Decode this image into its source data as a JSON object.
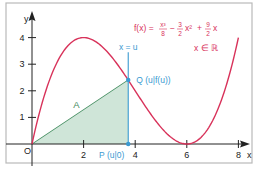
{
  "chart_data": {
    "type": "line",
    "title": "",
    "function_label": {
      "lhs": "f(x) = ",
      "t1_num": "x³",
      "t1_den": "8",
      "op1": "−",
      "t2_num": "3",
      "t2_den": "2",
      "t2_var": "x²",
      "op2": "+",
      "t3_num": "9",
      "t3_den": "2",
      "t3_var": "x"
    },
    "domain_label": "x ∈ ℝ",
    "xlabel": "x",
    "ylabel": "y",
    "xlim": [
      0,
      8.5
    ],
    "ylim": [
      0,
      4.7
    ],
    "x_ticks": [
      2,
      4,
      6,
      8
    ],
    "y_ticks": [
      1,
      2,
      3,
      4
    ],
    "origin_label": "O",
    "grid": false,
    "series": [
      {
        "name": "f(x) = x³/8 − 3/2·x² + 9/2·x",
        "color": "#d8325a",
        "x": [
          0,
          0.5,
          1,
          1.5,
          2,
          2.5,
          3,
          3.5,
          4,
          4.5,
          5,
          5.5,
          6,
          6.5,
          7,
          7.5,
          8
        ],
        "values": [
          0,
          1.89,
          3.13,
          3.8,
          4.0,
          3.83,
          3.38,
          2.73,
          2.0,
          1.27,
          0.63,
          0.16,
          0,
          0.22,
          0.88,
          2.11,
          4.0
        ]
      }
    ],
    "annotations": {
      "vertical_line": {
        "label": "x = u",
        "u": 3.73,
        "color": "#3a9ad1"
      },
      "point_Q": {
        "label": "Q (u|f(u))",
        "x": 3.73,
        "y": 2.41,
        "color": "#3a9ad1"
      },
      "point_P": {
        "label": "P (u|0)",
        "x": 3.73,
        "y": 0,
        "color": "#3a9ad1"
      },
      "area": {
        "label": "A",
        "vertices": [
          [
            0,
            0
          ],
          [
            3.73,
            0
          ],
          [
            3.73,
            2.41
          ]
        ],
        "fill": "#cfe5d8",
        "edge": "#3f8a5c"
      }
    }
  },
  "colors": {
    "curve": "#d8325a",
    "accent_blue": "#3a9ad1",
    "area_fill": "#cfe5d8",
    "area_edge": "#3f8a5c",
    "axis": "#222222",
    "frame": "#b9b9b9"
  }
}
